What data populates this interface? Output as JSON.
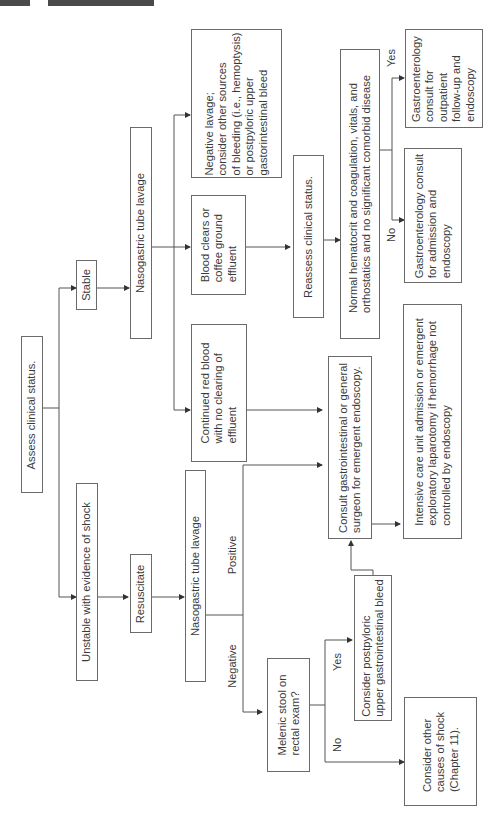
{
  "diagram": {
    "orientation": "rotated-90-ccw",
    "nodes": {
      "assess": "Assess clinical status.",
      "unstable": "Unstable with evidence of shock",
      "stable": "Stable",
      "resuscitate": "Resuscitate",
      "ngt_unstable": "Nasogastric tube lavage",
      "ngt_stable": "Nasogastric tube lavage",
      "continued_red": [
        "Continued red blood",
        "with no clearing of",
        "effluent"
      ],
      "blood_clears": [
        "Blood clears or",
        "coffee ground",
        "effluent"
      ],
      "negative_lavage": [
        "Negative lavage;",
        "consider other sources",
        "of bleeding (i.e., hemoptysis)",
        "or postpyloric upper",
        "gastorintestinal bleed"
      ],
      "reassess": "Reassess clinical status.",
      "normal_hct": [
        "Normal hematocrit and coagulation, vitals, and",
        "orthostatics and no significant comorbid disease"
      ],
      "gi_admission": [
        "Gastroenterology consult",
        "for admission and",
        "endoscopy"
      ],
      "gi_outpatient": [
        "Gastroenterology",
        "consult for",
        "outpatient",
        "follow-up and",
        "endoscopy"
      ],
      "consult_surgeon": [
        "Consult gastrointestinal or general",
        "surgeon for emergent endoscopy."
      ],
      "icu": [
        "Intensive care unit admission or emergent",
        "exploratory laparotomy if hemorrhage not",
        "controlled by endoscopy"
      ],
      "melenic": [
        "Melenic stool on",
        "rectal exam?"
      ],
      "postpyloric": [
        "Consider postpyloric",
        "upper gastrointestinal bleed"
      ],
      "other_causes": [
        "Consider other",
        "causes of shock",
        "(Chapter 11)."
      ]
    },
    "edge_labels": {
      "positive": "Positive",
      "negative": "Negative",
      "yes_melenic": "Yes",
      "no_melenic": "No",
      "yes_normal": "Yes",
      "no_normal": "No"
    },
    "colors": {
      "line": "#555555",
      "border": "#6a6a6a",
      "text": "#3a3a3a",
      "tab": "#4a4a4a"
    }
  }
}
